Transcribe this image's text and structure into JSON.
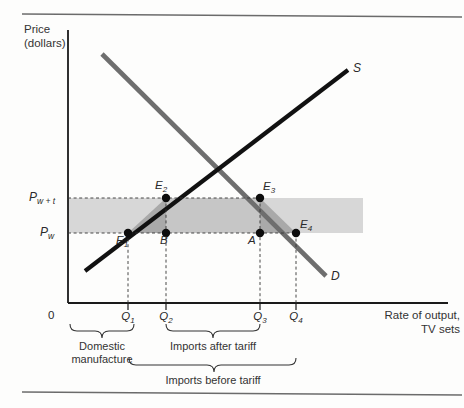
{
  "figure": {
    "axes": {
      "y_title_line1": "Price",
      "y_title_line2": "(dollars)",
      "x_title_line1": "Rate of output,",
      "x_title_line2": "TV sets",
      "origin": "0"
    },
    "price_levels": [
      {
        "name": "world-price-plus-tariff",
        "base": "P",
        "sub": "w + t",
        "y": 198
      },
      {
        "name": "world-price",
        "base": "P",
        "sub": "w",
        "y": 233
      }
    ],
    "quantity_ticks": [
      {
        "name": "q1",
        "base": "Q",
        "sub": "1",
        "x": 128
      },
      {
        "name": "q2",
        "base": "Q",
        "sub": "2",
        "x": 166
      },
      {
        "name": "q3",
        "base": "Q",
        "sub": "3",
        "x": 260
      },
      {
        "name": "q4",
        "base": "Q",
        "sub": "4",
        "x": 296
      }
    ],
    "curves": [
      {
        "name": "supply-curve",
        "label": "S",
        "color": "#111111"
      },
      {
        "name": "demand-curve",
        "label": "D",
        "color": "#6e6e6e"
      }
    ],
    "points": [
      {
        "name": "point-e1",
        "base": "E",
        "sub": "1",
        "x": 128,
        "y": 233
      },
      {
        "name": "point-e2",
        "base": "E",
        "sub": "2",
        "x": 166,
        "y": 198
      },
      {
        "name": "point-b",
        "base": "B",
        "sub": "",
        "x": 166,
        "y": 233
      },
      {
        "name": "point-a",
        "base": "A",
        "sub": "",
        "x": 260,
        "y": 233
      },
      {
        "name": "point-e3",
        "base": "E",
        "sub": "3",
        "x": 260,
        "y": 198
      },
      {
        "name": "point-e4",
        "base": "E",
        "sub": "4",
        "x": 296,
        "y": 233
      }
    ],
    "brackets": [
      {
        "name": "bracket-domestic",
        "line1": "Domestic",
        "line2": "manufacture"
      },
      {
        "name": "bracket-imports-after",
        "line1": "Imports after tariff",
        "line2": ""
      },
      {
        "name": "bracket-imports-before",
        "line1": "Imports before tariff",
        "line2": ""
      }
    ],
    "colors": {
      "tariff_band": "#d3d3d3",
      "tariff_revenue_box": "#c9c9c9",
      "deadweight_triangle": "#a8a8a8",
      "supply_line": "#111111",
      "demand_line": "#6e6e6e",
      "axis": "#1a1a1a",
      "rule": "#6b6b6b"
    }
  }
}
